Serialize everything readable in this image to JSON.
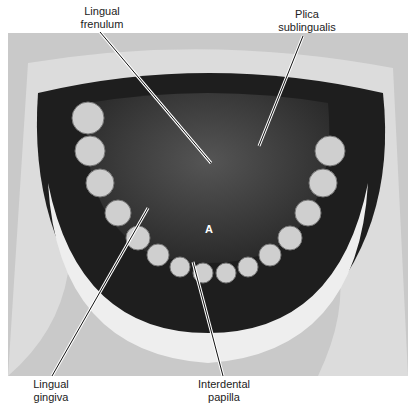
{
  "figure": {
    "labels": {
      "lingual_frenulum": [
        "Lingual",
        "frenulum"
      ],
      "plica_sublingualis": [
        "Plica",
        "sublingualis"
      ],
      "lingual_gingiva": [
        "Lingual",
        "gingiva"
      ],
      "interdental_papilla": [
        "Interdental",
        "papilla"
      ]
    },
    "marker": "A"
  }
}
